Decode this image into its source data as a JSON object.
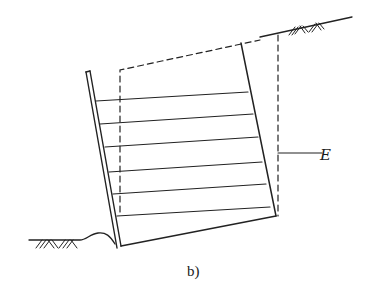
{
  "figure": {
    "caption": "b)",
    "labels": {
      "E": "E"
    },
    "elements": {
      "facing_wall": "facing-wall",
      "reinforcement_layers": 6,
      "ground_surface_upper": "ground-surface-upper",
      "ground_surface_lower": "ground-surface-lower",
      "boundary_dashed_inner": "dashed-boundary-inner",
      "boundary_dashed_outer": "dashed-boundary-outer"
    },
    "colors": {
      "stroke": "#222222",
      "background": "#ffffff"
    }
  }
}
